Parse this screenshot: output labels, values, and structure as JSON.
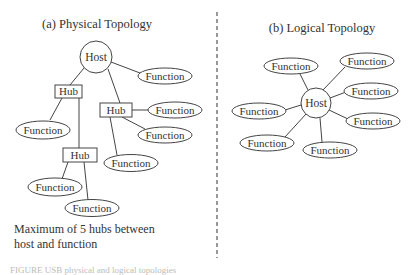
{
  "physical": {
    "title": "(a) Physical Topology",
    "host": {
      "label": "Host",
      "cx": 96,
      "cy": 57,
      "r": 16
    },
    "hubs": [
      {
        "id": "hub1",
        "label": "Hub",
        "x": 55,
        "y": 85,
        "w": 26,
        "h": 13
      },
      {
        "id": "hub2",
        "label": "Hub",
        "x": 100,
        "y": 103,
        "w": 32,
        "h": 14
      },
      {
        "id": "hub3",
        "label": "Hub",
        "x": 63,
        "y": 148,
        "w": 34,
        "h": 14
      }
    ],
    "functions": [
      {
        "label": "Function",
        "cx": 165,
        "cy": 76
      },
      {
        "label": "Function",
        "cx": 43,
        "cy": 130
      },
      {
        "label": "Function",
        "cx": 175,
        "cy": 110
      },
      {
        "label": "Function",
        "cx": 165,
        "cy": 135
      },
      {
        "label": "Function",
        "cx": 131,
        "cy": 163
      },
      {
        "label": "Function",
        "cx": 55,
        "cy": 187
      },
      {
        "label": "Function",
        "cx": 92,
        "cy": 208
      }
    ],
    "note_line1": "Maximum of 5 hubs between",
    "note_line2": "host and function"
  },
  "logical": {
    "title": "(b) Logical Topology",
    "host": {
      "label": "Host",
      "cx": 316,
      "cy": 103,
      "r": 15
    },
    "functions": [
      {
        "label": "Function",
        "cx": 291,
        "cy": 66
      },
      {
        "label": "Function",
        "cx": 367,
        "cy": 61
      },
      {
        "label": "Function",
        "cx": 371,
        "cy": 91
      },
      {
        "label": "Function",
        "cx": 259,
        "cy": 111
      },
      {
        "label": "Function",
        "cx": 373,
        "cy": 121
      },
      {
        "label": "Function",
        "cx": 267,
        "cy": 143
      },
      {
        "label": "Function",
        "cx": 330,
        "cy": 150
      }
    ]
  },
  "caption": "FIGURE          USB physical and logical topologies"
}
